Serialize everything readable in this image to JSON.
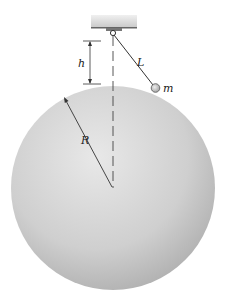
{
  "diagram": {
    "labels": {
      "height": "h",
      "length": "L",
      "mass": "m",
      "radius": "R"
    },
    "colors": {
      "sphere_light": "#e6e6e6",
      "sphere_dark": "#a9a9a9",
      "ceiling": "#d8d8d8",
      "line": "#333333",
      "bob": "#c8c8c8"
    }
  }
}
